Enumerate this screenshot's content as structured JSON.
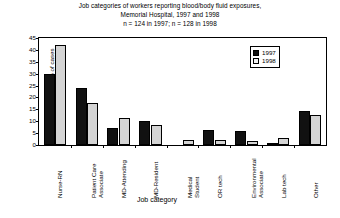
{
  "chart_data": {
    "type": "bar",
    "title_lines": [
      "Job categories of workers reporting blood/body fluid exposures,",
      "Memorial Hospital, 1997 and 1998",
      "n = 124 in 1997; n = 128 in 1998"
    ],
    "xlabel": "Job category",
    "ylabel": "% of cases",
    "ylim": [
      0,
      45
    ],
    "yticks": [
      0,
      5,
      10,
      15,
      20,
      25,
      30,
      35,
      40,
      45
    ],
    "grid": false,
    "legend_position": "top-right",
    "categories": [
      "Nurse-RN",
      "Patient Care Associate",
      "MD-Attending",
      "MD-Resident",
      "Medical Student",
      "OR tech",
      "Environmental Associate",
      "Lab tech",
      "Other"
    ],
    "category_label_lines": [
      [
        "Nurse-RN"
      ],
      [
        "Patient Care",
        "Associate"
      ],
      [
        "MD-Attending"
      ],
      [
        "MD-Resident"
      ],
      [
        "Medical",
        "Student"
      ],
      [
        "OR tech"
      ],
      [
        "Environmental",
        "Associate"
      ],
      [
        "Lab tech"
      ],
      [
        "Other"
      ]
    ],
    "series": [
      {
        "name": "1997",
        "color": "#111111",
        "values": [
          30,
          24,
          7,
          10,
          0,
          6.5,
          6,
          0.8,
          14.5
        ]
      },
      {
        "name": "1998",
        "color": "#d4d4d4",
        "values": [
          42,
          17.5,
          11.5,
          8.5,
          2,
          2,
          1.5,
          3,
          12.5
        ]
      }
    ]
  },
  "legend": {
    "entries": [
      {
        "label": "1997"
      },
      {
        "label": "1998"
      }
    ]
  }
}
